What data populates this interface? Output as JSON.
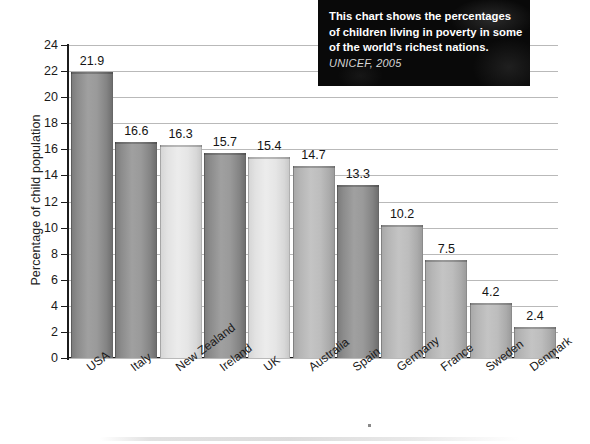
{
  "chart_data": {
    "type": "bar",
    "title": "",
    "subtitle": "",
    "xlabel": "",
    "ylabel": "Percentage of child population",
    "ylim": [
      0,
      24
    ],
    "ytick_step": 2,
    "yticks": [
      24,
      22,
      20,
      18,
      16,
      14,
      12,
      10,
      8,
      6,
      4,
      2,
      0
    ],
    "grid": true,
    "grid_axis": "y",
    "legend": "none",
    "categories": [
      "USA",
      "Italy",
      "New Zealand",
      "Ireland",
      "UK",
      "Australia",
      "Spain",
      "Germany",
      "France",
      "Sweden",
      "Denmark"
    ],
    "values": [
      21.9,
      16.6,
      16.3,
      15.7,
      15.4,
      14.7,
      13.3,
      10.2,
      7.5,
      4.2,
      2.4
    ],
    "value_labels": [
      "21.9",
      "16.6",
      "16.3",
      "15.7",
      "15.4",
      "14.7",
      "13.3",
      "10.2",
      "7.5",
      "4.2",
      "2.4"
    ],
    "bar_shades": [
      "dark",
      "dark",
      "light",
      "dark",
      "light",
      "mid",
      "dark",
      "mid",
      "mid",
      "mid",
      "mid"
    ],
    "annotation": {
      "text": "This chart shows the percentages of children living in poverty in some of the world's richest nations.",
      "source": "UNICEF, 2005",
      "position": "top-right"
    }
  },
  "colors": {
    "background": "#ffffff",
    "axis": "#1c1c1c",
    "gridline": "#b9b9b9",
    "bar_dark": "#9a9a9a",
    "bar_mid": "#bdbdbd",
    "bar_light": "#e6e6e6",
    "caption_background": "#090909",
    "caption_text": "#ffffff",
    "caption_source": "#d6d6d6"
  }
}
